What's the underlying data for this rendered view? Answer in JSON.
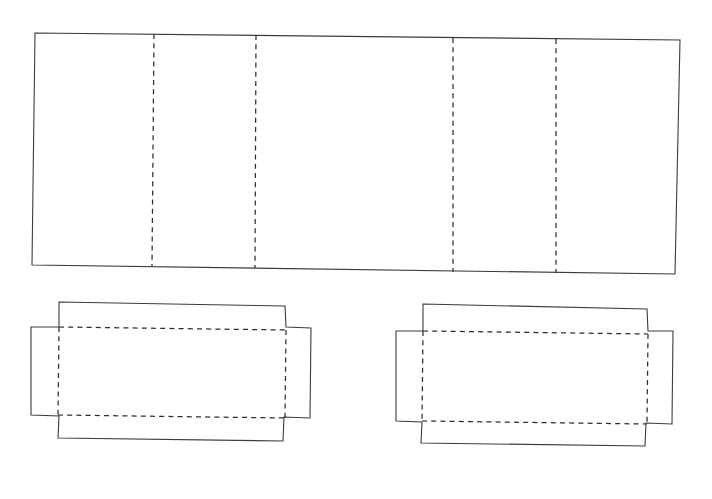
{
  "document": {
    "title": "Packaging Die-Line Drawing",
    "description": "Technical line drawing of a carton net: one long creased body strip above and two tray/lid blanks below",
    "background_color": "#ffffff",
    "cut_line_color": "#3c3c3c",
    "fold_line_color": "#2e2e2e",
    "canvas": {
      "width": 712,
      "height": 499
    }
  },
  "legend": {
    "solid_line_meaning": "cut line",
    "dashed_line_meaning": "fold / crease line"
  },
  "chart_data": {
    "type": "diagram",
    "xlabel": "",
    "ylabel": "",
    "grid": false,
    "legend_position": "none",
    "shapes": [
      {
        "name": "body-strip-panel",
        "kind": "outline",
        "line_style": "solid",
        "points": [
          [
            35,
            33
          ],
          [
            680,
            40
          ],
          [
            675,
            274
          ],
          [
            32,
            265
          ]
        ]
      },
      {
        "name": "body-crease-1",
        "kind": "fold",
        "line_style": "dashed",
        "points": [
          [
            154,
            34
          ],
          [
            152,
            266
          ]
        ]
      },
      {
        "name": "body-crease-2",
        "kind": "fold",
        "line_style": "dashed",
        "points": [
          [
            256,
            35
          ],
          [
            255,
            268
          ]
        ]
      },
      {
        "name": "body-crease-3",
        "kind": "fold",
        "line_style": "dashed",
        "points": [
          [
            453,
            38
          ],
          [
            453,
            272
          ]
        ]
      },
      {
        "name": "body-crease-4",
        "kind": "fold",
        "line_style": "dashed",
        "points": [
          [
            556,
            39
          ],
          [
            556,
            273
          ]
        ]
      },
      {
        "name": "left-blank-outline",
        "kind": "outline",
        "line_style": "solid",
        "points": [
          [
            59,
            302
          ],
          [
            285,
            306
          ],
          [
            286,
            327
          ],
          [
            311,
            328
          ],
          [
            310,
            418
          ],
          [
            284,
            417
          ],
          [
            283,
            441
          ],
          [
            58,
            438
          ],
          [
            59,
            416
          ],
          [
            31,
            415
          ],
          [
            31,
            327
          ],
          [
            59,
            327
          ]
        ]
      },
      {
        "name": "left-blank-fold-top",
        "kind": "fold",
        "line_style": "dashed",
        "points": [
          [
            59,
            327
          ],
          [
            286,
            330
          ]
        ]
      },
      {
        "name": "left-blank-fold-bottom",
        "kind": "fold",
        "line_style": "dashed",
        "points": [
          [
            58,
            415
          ],
          [
            285,
            418
          ]
        ]
      },
      {
        "name": "left-blank-fold-left",
        "kind": "fold",
        "line_style": "dashed",
        "points": [
          [
            59,
            327
          ],
          [
            58,
            416
          ]
        ]
      },
      {
        "name": "left-blank-fold-right",
        "kind": "fold",
        "line_style": "dashed",
        "points": [
          [
            286,
            330
          ],
          [
            285,
            418
          ]
        ]
      },
      {
        "name": "right-blank-outline",
        "kind": "outline",
        "line_style": "solid",
        "points": [
          [
            423,
            304
          ],
          [
            647,
            309
          ],
          [
            648,
            331
          ],
          [
            673,
            331
          ],
          [
            672,
            424
          ],
          [
            646,
            423
          ],
          [
            645,
            446
          ],
          [
            421,
            443
          ],
          [
            422,
            422
          ],
          [
            396,
            421
          ],
          [
            396,
            331
          ],
          [
            423,
            331
          ]
        ]
      },
      {
        "name": "right-blank-fold-top",
        "kind": "fold",
        "line_style": "dashed",
        "points": [
          [
            423,
            331
          ],
          [
            648,
            334
          ]
        ]
      },
      {
        "name": "right-blank-fold-bottom",
        "kind": "fold",
        "line_style": "dashed",
        "points": [
          [
            422,
            421
          ],
          [
            647,
            424
          ]
        ]
      },
      {
        "name": "right-blank-fold-left",
        "kind": "fold",
        "line_style": "dashed",
        "points": [
          [
            423,
            331
          ],
          [
            422,
            422
          ]
        ]
      },
      {
        "name": "right-blank-fold-right",
        "kind": "fold",
        "line_style": "dashed",
        "points": [
          [
            648,
            334
          ],
          [
            647,
            424
          ]
        ]
      }
    ],
    "annotations": []
  }
}
